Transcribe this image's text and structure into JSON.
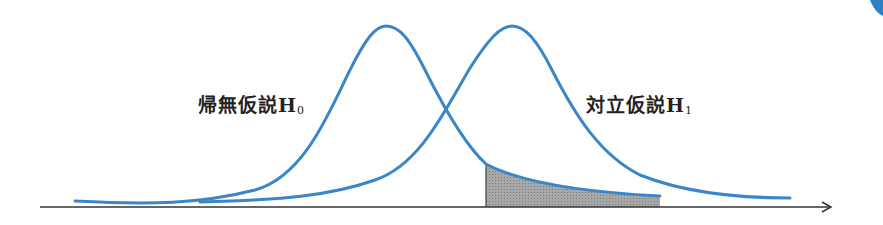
{
  "diagram": {
    "title": "",
    "labels": {
      "null_hypothesis": {
        "text": "帰無仮説H",
        "subscript": "0"
      },
      "alt_hypothesis": {
        "text": "対立仮説H",
        "subscript": "1"
      }
    },
    "colors": {
      "curve": "#3a86c8",
      "axis": "#333333",
      "shaded_region": "#9a9a9a",
      "corner_mark": "#2f7fc4"
    },
    "curves": [
      {
        "name": "null-distribution",
        "peak_x": 386,
        "peak_y": 26
      },
      {
        "name": "alternative-distribution",
        "peak_x": 512,
        "peak_y": 26
      }
    ],
    "shaded_region": {
      "x_start": 486,
      "x_end": 660,
      "description": "area under null tail right of critical value"
    }
  }
}
